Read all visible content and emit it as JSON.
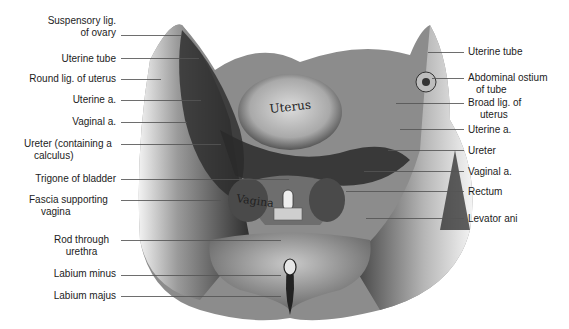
{
  "figure": {
    "illustration_text": {
      "uterus": "Uterus",
      "vagina": "Vagina"
    },
    "labels_left": [
      {
        "id": "suspensory-lig",
        "line1": "Suspensory lig.",
        "line2": "of ovary"
      },
      {
        "id": "uterine-tube-left",
        "line1": "Uterine tube",
        "line2": ""
      },
      {
        "id": "round-lig",
        "line1": "Round lig. of  uterus",
        "line2": ""
      },
      {
        "id": "uterine-a-left",
        "line1": "Uterine a.",
        "line2": ""
      },
      {
        "id": "vaginal-a-left",
        "line1": "Vaginal a.",
        "line2": ""
      },
      {
        "id": "ureter-calculus",
        "line1": "Ureter (containing a",
        "line2": "calculus)"
      },
      {
        "id": "trigone",
        "line1": "Trigone of bladder",
        "line2": ""
      },
      {
        "id": "fascia-vagina",
        "line1": "Fascia supporting",
        "line2": "vagina"
      },
      {
        "id": "rod-urethra",
        "line1": "Rod through",
        "line2": "urethra"
      },
      {
        "id": "labium-minus",
        "line1": "Labium minus",
        "line2": ""
      },
      {
        "id": "labium-majus",
        "line1": "Labium majus",
        "line2": ""
      }
    ],
    "labels_right": [
      {
        "id": "uterine-tube-right",
        "line1": "Uterine tube",
        "line2": ""
      },
      {
        "id": "abdominal-ostium",
        "line1": "Abdominal ostium",
        "line2": "of tube"
      },
      {
        "id": "broad-lig",
        "line1": "Broad lig. of",
        "line2": "uterus"
      },
      {
        "id": "uterine-a-right",
        "line1": "Uterine a.",
        "line2": ""
      },
      {
        "id": "ureter-right",
        "line1": "Ureter",
        "line2": ""
      },
      {
        "id": "vaginal-a-right",
        "line1": "Vaginal a.",
        "line2": ""
      },
      {
        "id": "rectum",
        "line1": "Rectum",
        "line2": ""
      },
      {
        "id": "levator-ani",
        "line1": "Levator ani",
        "line2": ""
      }
    ]
  }
}
